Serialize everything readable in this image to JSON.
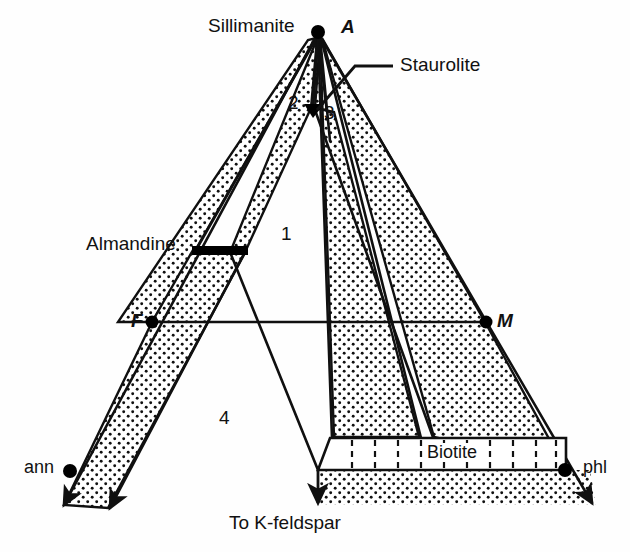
{
  "diagram": {
    "type": "AFM ternary phase diagram",
    "apex_labels": {
      "a_vertex": "A",
      "f_vertex": "F",
      "m_vertex": "M"
    },
    "mineral_labels": {
      "sillimanite": "Sillimanite",
      "staurolite": "Staurolite",
      "almandine": "Almandine",
      "biotite": "Biotite",
      "annite": "ann",
      "phlogopite": "phl"
    },
    "field_numbers": [
      "1",
      "2",
      "3",
      "4"
    ],
    "bottom_note": "To K-feldspar",
    "colors": {
      "line": "#101010",
      "stipple": "#101010",
      "background": "#fefefe",
      "solid_phase": "#000000"
    }
  }
}
